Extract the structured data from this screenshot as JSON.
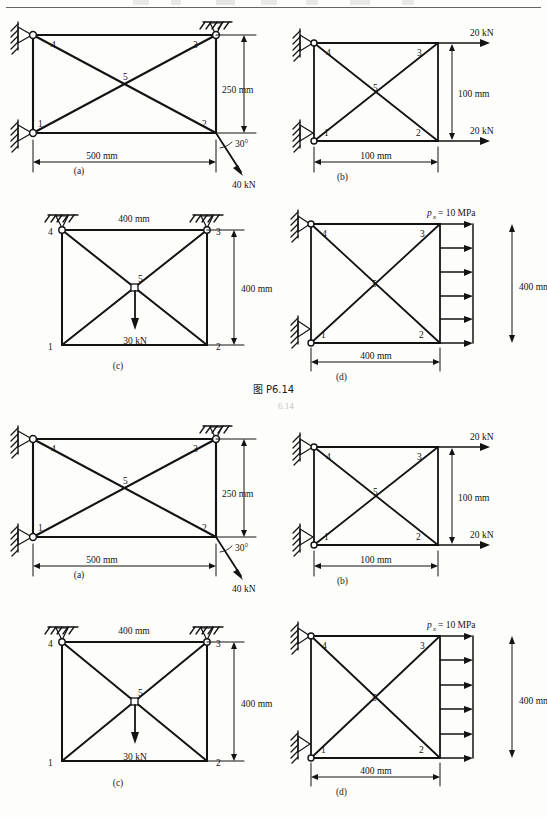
{
  "page": {
    "plate_caption": "图 P6.14",
    "header_fragment_right": "6.14",
    "background": "#fdfdfc",
    "ink": "#131313"
  },
  "figures": [
    {
      "id": "a",
      "caption": "(a)",
      "nodes": [
        "1",
        "2",
        "3",
        "4",
        "5"
      ],
      "dimensions": [
        {
          "name": "width",
          "label": "500 mm",
          "orientation": "horizontal"
        },
        {
          "name": "height",
          "label": "250 mm",
          "orientation": "vertical"
        }
      ],
      "loads": [
        {
          "name": "point-load",
          "label": "40 kN",
          "angle_label": "30°",
          "direction": "down-right"
        }
      ],
      "supports": [
        {
          "name": "wall-support-upper-left",
          "type": "fixed-hatched"
        },
        {
          "name": "wall-support-lower-left",
          "type": "fixed-hatched"
        },
        {
          "name": "ground-support-top-right",
          "type": "hatched-pin"
        }
      ]
    },
    {
      "id": "b",
      "caption": "(b)",
      "nodes": [
        "1",
        "2",
        "3",
        "4",
        "5"
      ],
      "dimensions": [
        {
          "name": "width",
          "label": "100 mm",
          "orientation": "horizontal"
        },
        {
          "name": "height",
          "label": "100 mm",
          "orientation": "vertical"
        }
      ],
      "loads": [
        {
          "name": "top-load",
          "label": "20 kN",
          "direction": "right"
        },
        {
          "name": "bottom-load",
          "label": "20 kN",
          "direction": "right"
        }
      ],
      "supports": [
        {
          "name": "wall-support-upper-left",
          "type": "fixed-hatched"
        },
        {
          "name": "wall-support-lower-left",
          "type": "fixed-hatched"
        }
      ]
    },
    {
      "id": "c",
      "caption": "(c)",
      "nodes": [
        "1",
        "2",
        "3",
        "4",
        "5"
      ],
      "dimensions": [
        {
          "name": "width",
          "label": "400 mm",
          "orientation": "horizontal"
        },
        {
          "name": "height",
          "label": "400 mm",
          "orientation": "vertical"
        }
      ],
      "loads": [
        {
          "name": "center-load",
          "label": "30 kN",
          "direction": "down"
        }
      ],
      "supports": [
        {
          "name": "ground-support-top-left",
          "type": "hatched-pin"
        },
        {
          "name": "ground-support-top-right",
          "type": "hatched-pin"
        }
      ]
    },
    {
      "id": "d",
      "caption": "(d)",
      "nodes": [
        "1",
        "2",
        "3",
        "4",
        "5"
      ],
      "dimensions": [
        {
          "name": "width",
          "label": "400 mm",
          "orientation": "horizontal"
        },
        {
          "name": "height",
          "label": "400 mm",
          "orientation": "vertical"
        }
      ],
      "loads": [
        {
          "name": "distributed-pressure",
          "symbol": "p",
          "subscript": "x",
          "equals": " = 10 MPa",
          "label": "px = 10 MPa",
          "arrow_count": 6,
          "direction": "right"
        }
      ],
      "supports": [
        {
          "name": "wall-support-upper-left",
          "type": "fixed-hatched"
        },
        {
          "name": "wall-support-lower-left",
          "type": "fixed-hatched"
        }
      ]
    }
  ]
}
